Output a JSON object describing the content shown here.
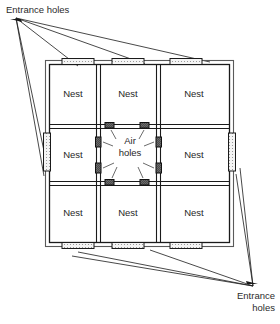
{
  "diagram": {
    "title_visible": false,
    "background_color": "#ffffff",
    "line_color": "#1a1a1a",
    "wall_fill": "#ffffff",
    "hole_fill": "#f2f2f2",
    "air_hole_fill": "#595959",
    "labels": {
      "entrance_top": "Entrance holes",
      "entrance_bottom": "Entrance\nholes",
      "air_holes": "Air\nholes"
    },
    "grid": {
      "rows": 3,
      "cols": 3,
      "cells": [
        {
          "row": 0,
          "col": 0,
          "label": "Nest"
        },
        {
          "row": 0,
          "col": 1,
          "label": "Nest"
        },
        {
          "row": 0,
          "col": 2,
          "label": "Nest"
        },
        {
          "row": 1,
          "col": 0,
          "label": "Nest"
        },
        {
          "row": 1,
          "col": 1,
          "label": "Air\nholes"
        },
        {
          "row": 1,
          "col": 2,
          "label": "Nest"
        },
        {
          "row": 2,
          "col": 0,
          "label": "Nest"
        },
        {
          "row": 2,
          "col": 1,
          "label": "Nest"
        },
        {
          "row": 2,
          "col": 2,
          "label": "Nest"
        }
      ]
    },
    "entrance_holes": {
      "count": 8,
      "top_wall": 3,
      "bottom_wall": 3,
      "left_wall": 1,
      "right_wall": 1
    },
    "air_holes": {
      "count": 8,
      "per_center_wall": 2
    }
  }
}
